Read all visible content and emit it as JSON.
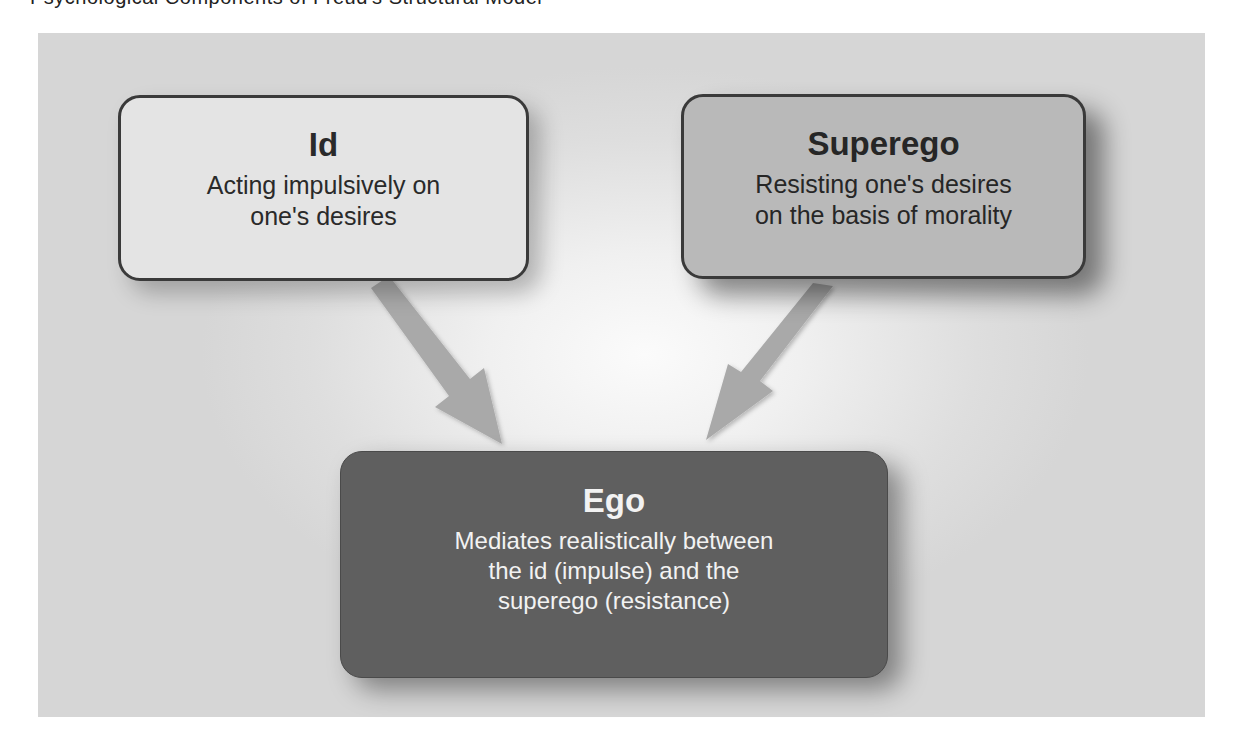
{
  "header_fragment": "Psychological Components of Freud's Structural Model",
  "diagram": {
    "nodes": [
      {
        "id": "id",
        "title": "Id",
        "description_lines": [
          "Acting impulsively on",
          "one's desires"
        ]
      },
      {
        "id": "superego",
        "title": "Superego",
        "description_lines": [
          "Resisting one's desires",
          "on the basis of morality"
        ]
      },
      {
        "id": "ego",
        "title": "Ego",
        "description_lines": [
          "Mediates realistically between",
          "the id (impulse) and the",
          "superego (resistance)"
        ]
      }
    ],
    "edges": [
      {
        "from": "id",
        "to": "ego"
      },
      {
        "from": "superego",
        "to": "ego"
      }
    ]
  },
  "colors": {
    "id_fill": "#e4e4e4",
    "superego_fill": "#b9b9b9",
    "ego_fill": "#5f5f5f",
    "arrow": "#a9a9a9",
    "border": "#3a3a3a"
  }
}
